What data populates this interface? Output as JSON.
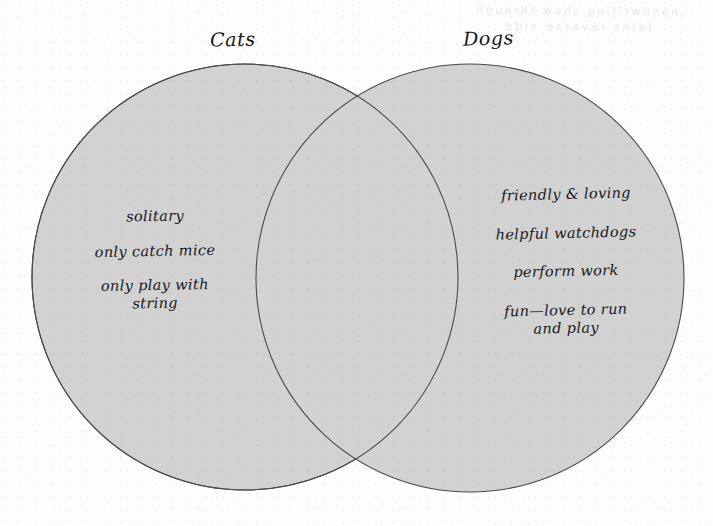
{
  "diagram": {
    "type": "venn",
    "background_color": "#fdfdfd",
    "fill_color": "#d2d2d2",
    "outline_color": "#4a4a4a",
    "left_circle": {
      "title": "Cats",
      "center_x": 245,
      "center_y": 277,
      "radius": 213,
      "items": [
        "solitary",
        "only catch mice",
        "only play with\nstring"
      ]
    },
    "right_circle": {
      "title": "Dogs",
      "center_x": 470,
      "center_y": 278,
      "radius": 214,
      "items": [
        "friendly & loving",
        "helpful watchdogs",
        "perform work",
        "fun—love to run\nand play"
      ]
    },
    "intersection": {
      "items": [],
      "top_point_y": 100,
      "bottom_point_y": 458
    },
    "bleed_through_ghost": {
      "line1": "handwriting show through",
      "line2": "faint reverse side"
    }
  }
}
